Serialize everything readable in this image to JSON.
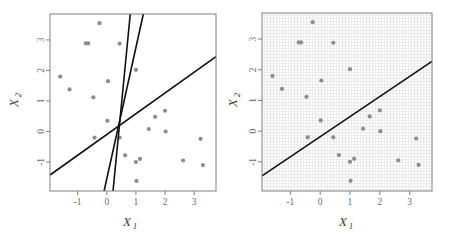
{
  "figure": {
    "background_color": "#ffffff",
    "panels": [
      {
        "id": "left",
        "name": "possible-separating-hyperplanes",
        "plot_bg": "#ffffff",
        "grid": false,
        "frame_color": "#808080"
      },
      {
        "id": "right",
        "name": "single-separating-hyperplane-with-regions",
        "plot_bg": "#fbfbfb",
        "grid": true,
        "frame_color": "#808080"
      }
    ]
  },
  "axes": {
    "x_title": "X",
    "x_title_sub": "1",
    "y_title": "X",
    "y_title_sub": "2",
    "x_ticks": [
      "-1",
      "0",
      "1",
      "2",
      "3"
    ],
    "y_ticks": [
      "-1",
      "0",
      "1",
      "2",
      "3"
    ],
    "x_tick_values": [
      -1,
      0,
      1,
      2,
      3
    ],
    "y_tick_values": [
      -1,
      0,
      1,
      2,
      3
    ],
    "tick_color": "#808080",
    "label_color": "#6b6b6b"
  },
  "chart_data": {
    "type": "scatter",
    "title": "",
    "subtitle": "",
    "xlabel": "X1",
    "ylabel": "X2",
    "xlim": [
      -1.95,
      3.75
    ],
    "ylim": [
      -1.95,
      3.85
    ],
    "grid": "right panel only (fine dotted grid)",
    "legend": "none",
    "point_color": "#8c8c8c",
    "point_radius_px": 2.1,
    "line_color": "#111111",
    "line_width_px": 1.6,
    "series": [
      {
        "name": "observations",
        "marker": "filled-circle",
        "color": "#8c8c8c",
        "points": [
          [
            -1.6,
            1.8
          ],
          [
            -1.28,
            1.38
          ],
          [
            -0.72,
            2.89
          ],
          [
            -0.64,
            2.89
          ],
          [
            -0.46,
            1.12
          ],
          [
            -0.42,
            -0.2
          ],
          [
            -0.25,
            3.55
          ],
          [
            0.02,
            0.35
          ],
          [
            0.04,
            1.65
          ],
          [
            0.44,
            2.88
          ],
          [
            0.44,
            -0.2
          ],
          [
            0.63,
            -0.78
          ],
          [
            1.0,
            2.02
          ],
          [
            1.0,
            -1.0
          ],
          [
            1.02,
            -1.62
          ],
          [
            1.14,
            -0.9
          ],
          [
            1.44,
            0.08
          ],
          [
            1.66,
            0.48
          ],
          [
            2.0,
            0.68
          ],
          [
            2.02,
            0.0
          ],
          [
            2.62,
            -0.95
          ],
          [
            3.22,
            -0.24
          ],
          [
            3.3,
            -1.1
          ]
        ]
      }
    ],
    "left_panel_lines": [
      {
        "name": "hyperplane-1-steep",
        "description": "near-vertical separating line",
        "slope": 9.8,
        "intercept": -4.05,
        "color": "#111111"
      },
      {
        "name": "hyperplane-2-medium",
        "description": "steep separating line tilted right",
        "slope": 4.3,
        "intercept": -1.55,
        "color": "#111111"
      },
      {
        "name": "hyperplane-3-shallow",
        "description": "shallow separating line",
        "slope": 0.68,
        "intercept": -0.1,
        "color": "#111111"
      }
    ],
    "right_panel_lines": [
      {
        "name": "chosen-separating-hyperplane",
        "description": "single separating hyperplane",
        "slope": 0.655,
        "intercept": -0.18,
        "color": "#111111"
      }
    ]
  }
}
